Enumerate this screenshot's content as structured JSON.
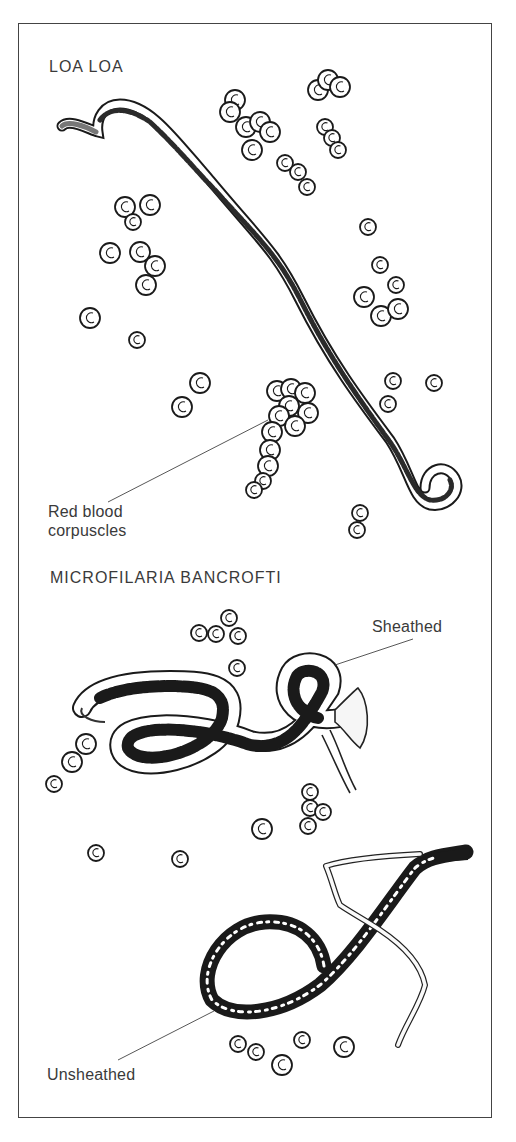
{
  "figure": {
    "sections": [
      {
        "title": "LOA LOA",
        "annotations": [
          {
            "text_line1": "Red blood",
            "text_line2": "corpuscles",
            "target": "red-blood-corpuscle-cluster"
          }
        ]
      },
      {
        "title": "MICROFILARIA BANCROFTI",
        "annotations": [
          {
            "text": "Sheathed",
            "target": "sheathed-microfilaria"
          },
          {
            "text": "Unsheathed",
            "target": "unsheathed-microfilaria"
          }
        ]
      }
    ],
    "colors": {
      "ink": "#1a1a1a",
      "label": "#3a3a3a",
      "frame": "#444444",
      "background": "#ffffff"
    }
  }
}
